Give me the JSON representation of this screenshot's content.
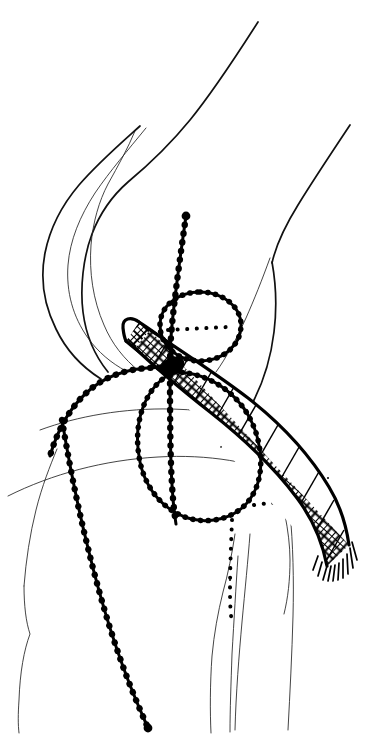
{
  "document": {
    "title": "Knee joint lateral view — patellar tendon graft reconstruction",
    "kind": "anatomical line drawing",
    "orientation": "lateral (side) view of right knee, flexed",
    "background_color": "#ffffff",
    "ink_color": "#000000",
    "width_px": 376,
    "height_px": 743,
    "caption": "",
    "labels": [],
    "visible_text": []
  },
  "legend_styles": {
    "solid_thin": "anatomical bone and soft-tissue contour",
    "beaded_chain": "suture / graft fixation strand drawn as a beaded line",
    "fine_dotted": "hidden (subsurface) tunnel or margin",
    "cross_hatched_band": "woven mesh graft strip with frayed distal end"
  },
  "structures": [
    {
      "id": "femur-anterior-cortex",
      "name": "Femur anterior cortex",
      "style": "solid_thin"
    },
    {
      "id": "femur-posterior-cortex",
      "name": "Femur posterior cortex",
      "style": "solid_thin"
    },
    {
      "id": "patella",
      "name": "Patella",
      "style": "solid_thin"
    },
    {
      "id": "quadriceps-tendon",
      "name": "Quadriceps tendon",
      "style": "solid_thin"
    },
    {
      "id": "femoral-condyle",
      "name": "Femoral condyle",
      "style": "solid_thin"
    },
    {
      "id": "tibial-plateau",
      "name": "Tibial plateau",
      "style": "solid_thin"
    },
    {
      "id": "tibia-shaft",
      "name": "Tibia shaft",
      "style": "solid_thin"
    },
    {
      "id": "fibula-head",
      "name": "Fibular head",
      "style": "solid_thin"
    },
    {
      "id": "patellar-loop-suture",
      "name": "Encircling beaded suture loop",
      "style": "beaded_chain"
    },
    {
      "id": "proximal-suture-limb",
      "name": "Proximal suture limb",
      "style": "beaded_chain"
    },
    {
      "id": "distal-suture-limb",
      "name": "Distal suture limb",
      "style": "beaded_chain"
    },
    {
      "id": "patella-hidden-margin",
      "name": "Hidden patellar margin",
      "style": "fine_dotted"
    },
    {
      "id": "tibial-tunnel-hidden",
      "name": "Hidden tibial tunnel outline",
      "style": "fine_dotted"
    },
    {
      "id": "mesh-graft-band",
      "name": "Woven mesh graft band",
      "style": "cross_hatched_band"
    },
    {
      "id": "mesh-graft-fringe",
      "name": "Frayed distal graft end",
      "style": "cross_hatched_band"
    }
  ],
  "colors": {
    "ink": "#000000",
    "paper": "#ffffff",
    "contour": "#1a1a1a"
  }
}
